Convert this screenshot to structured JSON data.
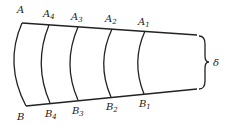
{
  "diagram": {
    "top_labels": [
      {
        "base": "A",
        "sub": "",
        "x": 17,
        "y": 13
      },
      {
        "base": "A",
        "sub": "4",
        "x": 43,
        "y": 17
      },
      {
        "base": "A",
        "sub": "3",
        "x": 71,
        "y": 20
      },
      {
        "base": "A",
        "sub": "2",
        "x": 105,
        "y": 22
      },
      {
        "base": "A",
        "sub": "1",
        "x": 138,
        "y": 25
      }
    ],
    "bottom_labels": [
      {
        "base": "B",
        "sub": "",
        "x": 17,
        "y": 120
      },
      {
        "base": "B",
        "sub": "4",
        "x": 45,
        "y": 117
      },
      {
        "base": "B",
        "sub": "3",
        "x": 72,
        "y": 114
      },
      {
        "base": "B",
        "sub": "2",
        "x": 106,
        "y": 110
      },
      {
        "base": "B",
        "sub": "1",
        "x": 139,
        "y": 107
      }
    ],
    "thickness_label": "δ"
  }
}
